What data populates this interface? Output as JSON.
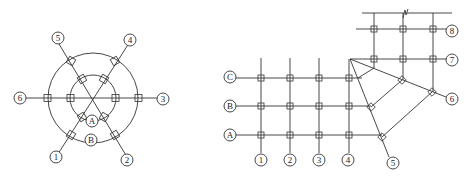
{
  "left_diagram": {
    "description": "Radial axis grid with two concentric rings and six radial axes",
    "center": [
      93,
      98
    ],
    "rings": [
      {
        "label": "A",
        "radius": 23
      },
      {
        "label": "B",
        "radius": 45
      }
    ],
    "radial_axes": [
      {
        "label": "1",
        "angle_deg": 240
      },
      {
        "label": "2",
        "angle_deg": 300
      },
      {
        "label": "3",
        "angle_deg": 0
      },
      {
        "label": "4",
        "angle_deg": 60
      },
      {
        "label": "5",
        "angle_deg": 120
      },
      {
        "label": "6",
        "angle_deg": 180
      }
    ]
  },
  "right_diagram": {
    "description": "Orthogonal grid joined to a rotated/fan grid with a skewed upper grid",
    "row_labels": [
      "C",
      "B",
      "A"
    ],
    "column_labels": [
      "1",
      "2",
      "3",
      "4"
    ],
    "fan_labels": [
      "5",
      "6"
    ],
    "upper_row_labels": [
      "7",
      "8"
    ]
  },
  "labels": {
    "l1": "1",
    "l2": "2",
    "l3": "3",
    "l4": "4",
    "l5": "5",
    "l6": "6",
    "lA": "A",
    "lB": "B",
    "rC": "C",
    "rB": "B",
    "rA": "A",
    "r1": "1",
    "r2": "2",
    "r3": "3",
    "r4": "4",
    "r5": "5",
    "r6": "6",
    "r7": "7",
    "r8": "8"
  },
  "colors": {
    "line": "#333333",
    "background": "#ffffff"
  }
}
